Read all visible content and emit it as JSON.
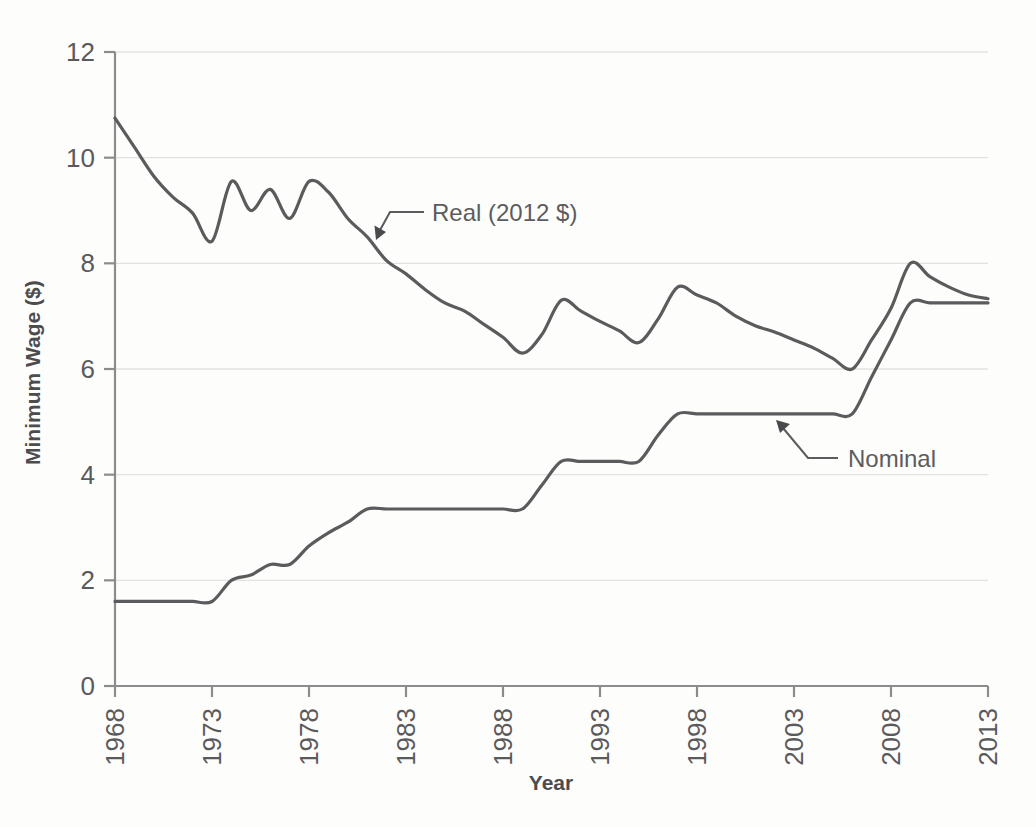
{
  "chart_data": {
    "type": "line",
    "title": "",
    "xlabel": "Year",
    "ylabel": "Minimum Wage ($)",
    "xlim": [
      1968,
      2013
    ],
    "ylim": [
      0,
      12
    ],
    "yticks": [
      0,
      2,
      4,
      6,
      8,
      10,
      12
    ],
    "ytick_labels": [
      "0",
      "2",
      "4",
      "6",
      "8",
      "10",
      "12"
    ],
    "xticks": [
      1968,
      1973,
      1978,
      1983,
      1988,
      1993,
      1998,
      2003,
      2008,
      2013
    ],
    "xtick_labels": [
      "1968",
      "1973",
      "1978",
      "1983",
      "1988",
      "1993",
      "1998",
      "2003",
      "2008",
      "2013"
    ],
    "grid": "horizontal",
    "legend": "none",
    "annotations": [
      {
        "label": "Real (2012 $)",
        "points_to_year": 1981,
        "points_to_value": 8.5
      },
      {
        "label": "Nominal",
        "points_to_year": 2004,
        "points_to_value": 5.15
      }
    ],
    "x": [
      1968,
      1969,
      1970,
      1971,
      1972,
      1973,
      1974,
      1975,
      1976,
      1977,
      1978,
      1979,
      1980,
      1981,
      1982,
      1983,
      1984,
      1985,
      1986,
      1987,
      1988,
      1989,
      1990,
      1991,
      1992,
      1993,
      1994,
      1995,
      1996,
      1997,
      1998,
      1999,
      2000,
      2001,
      2002,
      2003,
      2004,
      2005,
      2006,
      2007,
      2008,
      2009,
      2010,
      2011,
      2012,
      2013
    ],
    "series": [
      {
        "name": "Real (2012 $)",
        "values": [
          10.75,
          10.2,
          9.65,
          9.25,
          8.95,
          8.42,
          9.55,
          9.0,
          9.4,
          8.85,
          9.55,
          9.35,
          8.85,
          8.5,
          8.05,
          7.8,
          7.5,
          7.25,
          7.1,
          6.85,
          6.6,
          6.3,
          6.65,
          7.3,
          7.1,
          6.9,
          6.72,
          6.5,
          6.95,
          7.55,
          7.4,
          7.25,
          7.0,
          6.82,
          6.7,
          6.55,
          6.4,
          6.2,
          6.0,
          6.55,
          7.15,
          8.0,
          7.75,
          7.55,
          7.4,
          7.33
        ]
      },
      {
        "name": "Nominal",
        "values": [
          1.6,
          1.6,
          1.6,
          1.6,
          1.6,
          1.6,
          2.0,
          2.1,
          2.3,
          2.3,
          2.65,
          2.9,
          3.1,
          3.35,
          3.35,
          3.35,
          3.35,
          3.35,
          3.35,
          3.35,
          3.35,
          3.35,
          3.8,
          4.25,
          4.25,
          4.25,
          4.25,
          4.25,
          4.75,
          5.15,
          5.15,
          5.15,
          5.15,
          5.15,
          5.15,
          5.15,
          5.15,
          5.15,
          5.15,
          5.85,
          6.55,
          7.25,
          7.25,
          7.25,
          7.25,
          7.25
        ]
      }
    ]
  },
  "axes": {
    "y_title": "Minimum Wage ($)",
    "x_title": "Year"
  }
}
